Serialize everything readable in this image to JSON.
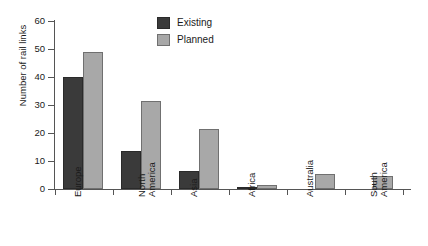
{
  "chart_data": {
    "type": "bar",
    "title": "",
    "xlabel": "",
    "ylabel": "Number of rail links",
    "ylim": [
      0,
      60
    ],
    "ytick_labels": [
      "60",
      "50",
      "40",
      "30",
      "20",
      "10",
      "0"
    ],
    "ytick_values": [
      60,
      50,
      40,
      30,
      20,
      10,
      0
    ],
    "grid": false,
    "legend_position": "top-center",
    "categories": [
      "Europe",
      "North America",
      "Asia",
      "Africa",
      "Australia",
      "South America"
    ],
    "category_lines": [
      [
        "Europe"
      ],
      [
        "North",
        "America"
      ],
      [
        "Asia"
      ],
      [
        "Africa"
      ],
      [
        "Australia"
      ],
      [
        "South",
        "America"
      ]
    ],
    "series": [
      {
        "name": "Existing",
        "color": "#3a3a3a",
        "values": [
          40,
          13.5,
          6.5,
          0.5,
          0,
          0
        ]
      },
      {
        "name": "Planned",
        "color": "#a8a8a8",
        "values": [
          49,
          31.5,
          21.5,
          1.5,
          5.5,
          4.5
        ]
      }
    ]
  },
  "legend": {
    "items": [
      {
        "label": "Existing",
        "swatch": "existing"
      },
      {
        "label": "Planned",
        "swatch": "planned"
      }
    ]
  },
  "colors": {
    "existing": "#3a3a3a",
    "planned": "#a8a8a8",
    "axis": "#555555",
    "text": "#1a1a1a",
    "background": "#ffffff"
  }
}
